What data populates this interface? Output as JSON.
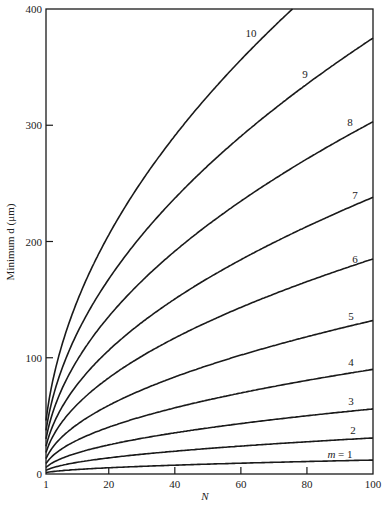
{
  "chart_data": {
    "type": "line",
    "title": "",
    "xlabel": "N",
    "ylabel": "Minimum d (μm)",
    "xlim": [
      1,
      100
    ],
    "ylim": [
      0,
      400
    ],
    "x_ticks": [
      1,
      20,
      40,
      60,
      80,
      100
    ],
    "y_ticks": [
      0,
      100,
      200,
      300,
      400
    ],
    "grid": false,
    "legend": "inline labels at right end of each curve",
    "x": [
      1,
      10,
      20,
      40,
      60,
      76,
      80,
      100
    ],
    "series": [
      {
        "name": "m = 1",
        "label": "m = 1",
        "values": [
          1.2,
          3.8,
          5.4,
          7.6,
          9.3,
          10.5,
          10.7,
          12
        ]
      },
      {
        "name": "m = 2",
        "label": "2",
        "values": [
          3.1,
          9.8,
          13.9,
          19.6,
          24.0,
          27.0,
          27.7,
          31
        ]
      },
      {
        "name": "m = 3",
        "label": "3",
        "values": [
          5.6,
          17.7,
          25.0,
          35.4,
          43.4,
          48.8,
          50.1,
          56
        ]
      },
      {
        "name": "m = 4",
        "label": "4",
        "values": [
          9.0,
          28.5,
          40.2,
          56.9,
          69.7,
          78.5,
          80.5,
          90
        ]
      },
      {
        "name": "m = 5",
        "label": "5",
        "values": [
          13.2,
          41.7,
          59.0,
          83.5,
          102.2,
          115.1,
          118.1,
          132
        ]
      },
      {
        "name": "m = 6",
        "label": "6",
        "values": [
          18.5,
          58.5,
          82.7,
          117.0,
          143.3,
          161.3,
          165.5,
          185
        ]
      },
      {
        "name": "m = 7",
        "label": "7",
        "values": [
          23.8,
          75.3,
          106.4,
          150.5,
          184.4,
          207.5,
          212.9,
          238
        ]
      },
      {
        "name": "m = 8",
        "label": "8",
        "values": [
          30.3,
          95.8,
          135.5,
          191.6,
          234.7,
          264.1,
          271.0,
          303
        ]
      },
      {
        "name": "m = 9",
        "label": "9",
        "values": [
          37.5,
          118.6,
          167.7,
          237.2,
          290.5,
          326.9,
          335.4,
          375
        ]
      },
      {
        "name": "m = 10",
        "label": "10",
        "values": [
          46.0,
          145.5,
          205.7,
          290.9,
          356.3,
          400.0,
          null,
          null
        ]
      }
    ],
    "curve_k": [
      1.2,
      3.1,
      5.6,
      9.0,
      13.2,
      18.5,
      23.8,
      30.3,
      37.5,
      46.0
    ],
    "curve_labels": [
      "m = 1",
      "2",
      "3",
      "4",
      "5",
      "6",
      "7",
      "8",
      "9",
      "10"
    ],
    "label_positions": [
      {
        "x": 340,
        "y": 458
      },
      {
        "x": 353,
        "y": 434
      },
      {
        "x": 351,
        "y": 405
      },
      {
        "x": 351,
        "y": 366
      },
      {
        "x": 351,
        "y": 320
      },
      {
        "x": 355,
        "y": 263
      },
      {
        "x": 355,
        "y": 199
      },
      {
        "x": 350,
        "y": 126
      },
      {
        "x": 305,
        "y": 78
      },
      {
        "x": 251,
        "y": 37
      }
    ]
  },
  "axes": {
    "x_title": "N",
    "y_title": "Minimum d (μm)",
    "x_tick_labels": [
      "1",
      "20",
      "40",
      "60",
      "80",
      "100"
    ],
    "y_tick_labels": [
      "0",
      "100",
      "200",
      "300",
      "400"
    ]
  }
}
